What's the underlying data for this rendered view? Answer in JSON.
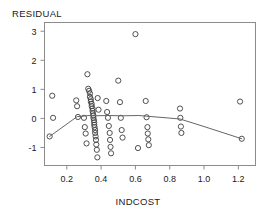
{
  "chart_data": {
    "type": "scatter",
    "title": "RESIDUAL",
    "xlabel": "INDCOST",
    "ylabel": "RESIDUAL",
    "grid": false,
    "legend": null,
    "xlim": [
      0.07,
      1.3
    ],
    "ylim": [
      -1.62,
      3.3
    ],
    "xticks": [
      "0.2",
      "0.4",
      "0.6",
      "0.8",
      "1.0",
      "1.2"
    ],
    "xtick_values": [
      0.2,
      0.4,
      0.6,
      0.8,
      1.0,
      1.2
    ],
    "yticks": [
      "3",
      "2",
      "1",
      "0",
      "-1"
    ],
    "ytick_values": [
      3,
      2,
      1,
      0,
      -1
    ],
    "marker": "open-circle",
    "points": [
      [
        0.1,
        -0.62
      ],
      [
        0.115,
        0.78
      ],
      [
        0.12,
        0.02
      ],
      [
        0.255,
        0.62
      ],
      [
        0.26,
        0.42
      ],
      [
        0.265,
        0.05
      ],
      [
        0.3,
        0.02
      ],
      [
        0.305,
        -0.3
      ],
      [
        0.31,
        -0.52
      ],
      [
        0.315,
        -0.86
      ],
      [
        0.32,
        1.52
      ],
      [
        0.325,
        1.02
      ],
      [
        0.33,
        0.95
      ],
      [
        0.335,
        0.86
      ],
      [
        0.335,
        0.74
      ],
      [
        0.34,
        0.66
      ],
      [
        0.34,
        0.58
      ],
      [
        0.345,
        0.5
      ],
      [
        0.345,
        0.42
      ],
      [
        0.35,
        0.34
      ],
      [
        0.35,
        0.26
      ],
      [
        0.352,
        0.18
      ],
      [
        0.355,
        0.1
      ],
      [
        0.355,
        0.02
      ],
      [
        0.358,
        -0.06
      ],
      [
        0.36,
        -0.14
      ],
      [
        0.36,
        -0.22
      ],
      [
        0.362,
        -0.3
      ],
      [
        0.365,
        -0.4
      ],
      [
        0.365,
        -0.5
      ],
      [
        0.368,
        -0.62
      ],
      [
        0.37,
        -0.74
      ],
      [
        0.372,
        -0.9
      ],
      [
        0.375,
        -1.08
      ],
      [
        0.378,
        -1.34
      ],
      [
        0.38,
        0.7
      ],
      [
        0.385,
        0.3
      ],
      [
        0.43,
        0.6
      ],
      [
        0.435,
        0.22
      ],
      [
        0.44,
        0.02
      ],
      [
        0.445,
        -0.26
      ],
      [
        0.45,
        -0.5
      ],
      [
        0.452,
        -0.74
      ],
      [
        0.455,
        -0.98
      ],
      [
        0.458,
        -1.2
      ],
      [
        0.5,
        1.3
      ],
      [
        0.51,
        0.56
      ],
      [
        0.515,
        0.02
      ],
      [
        0.52,
        -0.4
      ],
      [
        0.525,
        -0.66
      ],
      [
        0.6,
        2.9
      ],
      [
        0.615,
        -1.02
      ],
      [
        0.66,
        0.6
      ],
      [
        0.665,
        0.04
      ],
      [
        0.67,
        -0.3
      ],
      [
        0.672,
        -0.52
      ],
      [
        0.675,
        -0.72
      ],
      [
        0.678,
        -0.92
      ],
      [
        0.86,
        0.34
      ],
      [
        0.862,
        0.02
      ],
      [
        0.865,
        -0.28
      ],
      [
        0.868,
        -0.5
      ],
      [
        1.21,
        0.58
      ],
      [
        1.22,
        -0.7
      ]
    ],
    "smooth_line": {
      "name": "lowess",
      "x": [
        0.1,
        0.26,
        0.33,
        0.36,
        0.44,
        0.52,
        0.62,
        0.72,
        0.86,
        1.0,
        1.22
      ],
      "y": [
        -0.62,
        0.06,
        0.1,
        0.09,
        0.1,
        0.09,
        0.1,
        0.05,
        -0.02,
        -0.28,
        -0.7
      ]
    }
  }
}
